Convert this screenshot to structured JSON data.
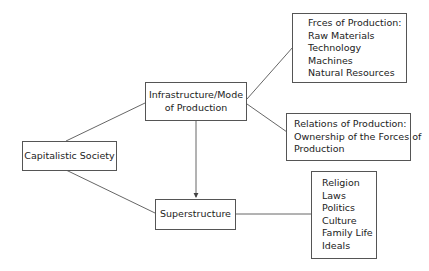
{
  "diagram": {
    "root": {
      "label": "Capitalistic Society"
    },
    "infrastructure": {
      "label": "Infrastructure/Mode of Production",
      "line1": "Infrastructure/Mode",
      "line2": "of Production"
    },
    "superstructure": {
      "label": "Superstructure"
    },
    "forces": {
      "title": "Frces of Production:",
      "items": [
        "Raw Materials",
        "Technology",
        "Machines",
        "Natural Resources"
      ]
    },
    "relations": {
      "lines": [
        "Relations of Production:",
        "Ownership of the Forces of",
        "Production"
      ]
    },
    "super_items": [
      "Religion",
      "Laws",
      "Politics",
      "Culture",
      "Family Life",
      "Ideals"
    ],
    "edges": [
      [
        "Capitalistic Society",
        "Infrastructure/Mode of Production"
      ],
      [
        "Capitalistic Society",
        "Superstructure"
      ],
      [
        "Infrastructure/Mode of Production",
        "Superstructure",
        "arrow"
      ],
      [
        "Infrastructure/Mode of Production",
        "Frces of Production"
      ],
      [
        "Infrastructure/Mode of Production",
        "Relations of Production"
      ],
      [
        "Superstructure",
        "Religion/Laws/Politics/Culture/Family Life/Ideals"
      ]
    ],
    "colors": {
      "line": "#555555",
      "text": "#222222",
      "background": "#ffffff"
    }
  }
}
